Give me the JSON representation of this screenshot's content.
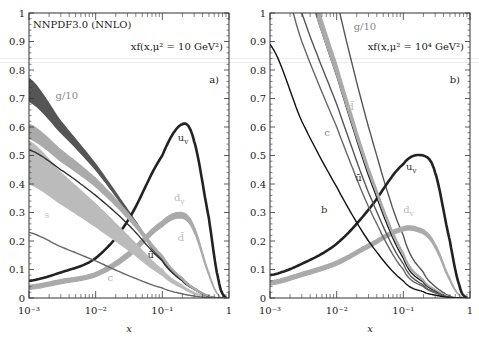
{
  "chart_data": [
    {
      "type": "line",
      "panel": "a)",
      "title": "NNPDF3.0 (NNLO)",
      "annotation": "xf(x,μ² = 10 GeV²)",
      "xlabel": "x",
      "ylabel": "",
      "xscale": "log",
      "xlim": [
        0.001,
        1
      ],
      "ylim": [
        0,
        1
      ],
      "xticks": [
        "10⁻³",
        "10⁻²",
        "10⁻¹",
        "1"
      ],
      "yticks": [
        "0",
        "0.1",
        "0.2",
        "0.3",
        "0.4",
        "0.5",
        "0.6",
        "0.7",
        "0.8",
        "0.9",
        "1"
      ],
      "x": [
        0.001,
        0.003,
        0.01,
        0.03,
        0.1,
        0.2,
        0.3,
        0.5,
        0.7,
        0.9
      ],
      "series": [
        {
          "name": "g/10",
          "color": "#555555",
          "band": true,
          "upper": [
            0.77,
            0.62,
            0.47,
            0.31,
            0.14,
            0.07,
            0.035,
            0.008,
            0.001,
            0
          ],
          "lower": [
            0.69,
            0.58,
            0.45,
            0.3,
            0.13,
            0.065,
            0.032,
            0.007,
            0.001,
            0
          ]
        },
        {
          "name": "u_v",
          "color": "#222222",
          "band": false,
          "values": [
            0.06,
            0.09,
            0.14,
            0.27,
            0.5,
            0.61,
            0.55,
            0.28,
            0.06,
            0.0
          ]
        },
        {
          "name": "d_v",
          "color": "#aaaaaa",
          "band": true,
          "upper": [
            0.045,
            0.065,
            0.09,
            0.16,
            0.27,
            0.3,
            0.25,
            0.09,
            0.01,
            0.0
          ],
          "lower": [
            0.03,
            0.05,
            0.075,
            0.14,
            0.25,
            0.28,
            0.23,
            0.08,
            0.008,
            0.0
          ]
        },
        {
          "name": "s",
          "color": "#bbbbbb",
          "band": true,
          "upper": [
            0.55,
            0.44,
            0.33,
            0.22,
            0.1,
            0.045,
            0.02,
            0.004,
            0.0,
            0.0
          ],
          "lower": [
            0.4,
            0.33,
            0.25,
            0.17,
            0.08,
            0.035,
            0.015,
            0.003,
            0.0,
            0.0
          ]
        },
        {
          "name": "ū",
          "color": "#333333",
          "band": false,
          "values": [
            0.52,
            0.45,
            0.36,
            0.26,
            0.13,
            0.06,
            0.03,
            0.005,
            0.0,
            0.0
          ]
        },
        {
          "name": "d̄",
          "color": "#aaaaaa",
          "band": true,
          "upper": [
            0.61,
            0.52,
            0.42,
            0.3,
            0.15,
            0.07,
            0.035,
            0.007,
            0.0,
            0.0
          ],
          "lower": [
            0.56,
            0.48,
            0.39,
            0.28,
            0.14,
            0.065,
            0.03,
            0.006,
            0.0,
            0.0
          ]
        },
        {
          "name": "c",
          "color": "#666666",
          "band": false,
          "values": [
            0.23,
            0.18,
            0.13,
            0.08,
            0.035,
            0.015,
            0.007,
            0.001,
            0.0,
            0.0
          ]
        }
      ],
      "labels": [
        {
          "text": "g/10",
          "x": 0.0025,
          "y": 0.7,
          "color": "#888888"
        },
        {
          "text": "u_v",
          "x": 0.17,
          "y": 0.55,
          "color": "#333333"
        },
        {
          "text": "d_v",
          "x": 0.15,
          "y": 0.34,
          "color": "#bbbbbb"
        },
        {
          "text": "d̄",
          "x": 0.17,
          "y": 0.2,
          "color": "#bbbbbb"
        },
        {
          "text": "ū",
          "x": 0.06,
          "y": 0.14,
          "color": "#333333"
        },
        {
          "text": "s",
          "x": 0.0017,
          "y": 0.28,
          "color": "#cccccc"
        },
        {
          "text": "c",
          "x": 0.015,
          "y": 0.06,
          "color": "#aaaaaa"
        }
      ]
    },
    {
      "type": "line",
      "panel": "b)",
      "annotation": "xf(x,μ² = 10⁴ GeV²)",
      "xlabel": "x",
      "ylabel": "",
      "xscale": "log",
      "xlim": [
        0.001,
        1
      ],
      "ylim": [
        0,
        1
      ],
      "xticks": [
        "10⁻³",
        "10⁻²",
        "10⁻¹",
        "1"
      ],
      "yticks": [
        "0",
        "0.1",
        "0.2",
        "0.3",
        "0.4",
        "0.5",
        "0.6",
        "0.7",
        "0.8",
        "0.9",
        "1"
      ],
      "x": [
        0.001,
        0.003,
        0.01,
        0.03,
        0.1,
        0.2,
        0.3,
        0.5,
        0.7,
        0.9
      ],
      "series": [
        {
          "name": "g/10",
          "color": "#555555",
          "band": false,
          "values": [
            2.2,
            1.6,
            1.05,
            0.6,
            0.22,
            0.09,
            0.04,
            0.007,
            0.0,
            0.0
          ]
        },
        {
          "name": "u_v",
          "color": "#222222",
          "band": false,
          "values": [
            0.08,
            0.12,
            0.19,
            0.31,
            0.47,
            0.5,
            0.44,
            0.2,
            0.04,
            0.0
          ]
        },
        {
          "name": "d_v",
          "color": "#aaaaaa",
          "band": true,
          "upper": [
            0.06,
            0.09,
            0.13,
            0.19,
            0.25,
            0.24,
            0.19,
            0.07,
            0.01,
            0.0
          ],
          "lower": [
            0.045,
            0.075,
            0.115,
            0.175,
            0.235,
            0.225,
            0.175,
            0.06,
            0.008,
            0.0
          ]
        },
        {
          "name": "s",
          "color": "#555555",
          "band": false,
          "values": [
            1.4,
            1.0,
            0.68,
            0.37,
            0.12,
            0.045,
            0.02,
            0.003,
            0.0,
            0.0
          ]
        },
        {
          "name": "ū",
          "color": "#222222",
          "band": false,
          "values": [
            1.55,
            1.15,
            0.78,
            0.43,
            0.14,
            0.055,
            0.025,
            0.004,
            0.0,
            0.0
          ]
        },
        {
          "name": "d̄",
          "color": "#aaaaaa",
          "band": true,
          "upper": [
            1.6,
            1.2,
            0.82,
            0.46,
            0.16,
            0.065,
            0.03,
            0.005,
            0.0,
            0.0
          ],
          "lower": [
            1.55,
            1.15,
            0.78,
            0.44,
            0.15,
            0.06,
            0.028,
            0.004,
            0.0,
            0.0
          ]
        },
        {
          "name": "c",
          "color": "#666666",
          "band": false,
          "values": [
            1.25,
            0.9,
            0.6,
            0.32,
            0.1,
            0.04,
            0.018,
            0.003,
            0.0,
            0.0
          ]
        },
        {
          "name": "b",
          "color": "#111111",
          "band": false,
          "values": [
            0.89,
            0.62,
            0.39,
            0.2,
            0.06,
            0.022,
            0.01,
            0.002,
            0.0,
            0.0
          ]
        }
      ],
      "labels": [
        {
          "text": "g/10",
          "x": 0.018,
          "y": 0.94,
          "color": "#888888"
        },
        {
          "text": "d̄",
          "x": 0.0145,
          "y": 0.66,
          "color": "#bbbbbb"
        },
        {
          "text": "c",
          "x": 0.0065,
          "y": 0.57,
          "color": "#888888"
        },
        {
          "text": "ū",
          "x": 0.019,
          "y": 0.41,
          "color": "#333333"
        },
        {
          "text": "b",
          "x": 0.0058,
          "y": 0.3,
          "color": "#333333"
        },
        {
          "text": "u_v",
          "x": 0.11,
          "y": 0.45,
          "color": "#333333"
        },
        {
          "text": "d_v",
          "x": 0.1,
          "y": 0.3,
          "color": "#bbbbbb"
        }
      ]
    }
  ],
  "panels": [
    {
      "id": "a",
      "tag": "a)",
      "title": "NNPDF3.0 (NNLO)",
      "annotation": "xf(x,μ² = 10 GeV²)",
      "xlabel": "x"
    },
    {
      "id": "b",
      "tag": "b)",
      "title": "",
      "annotation": "xf(x,μ² = 10⁴ GeV²)",
      "xlabel": "x"
    }
  ]
}
